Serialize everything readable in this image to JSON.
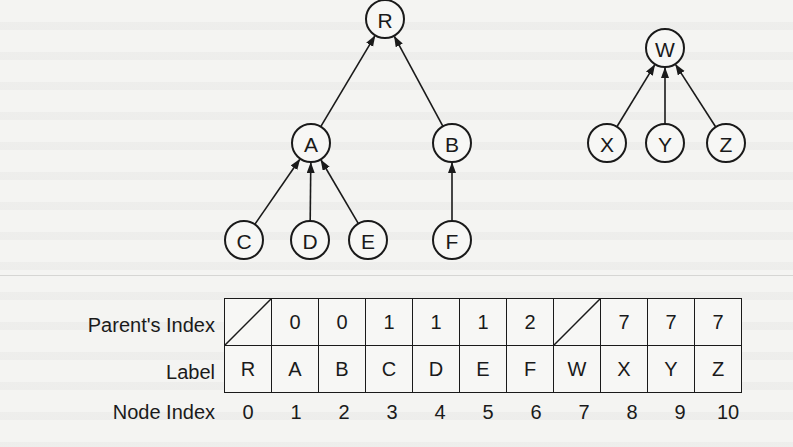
{
  "diagram": {
    "trees": [
      {
        "root": "R",
        "nodes": [
          {
            "id": "R",
            "label": "R",
            "x": 385,
            "y": 19
          },
          {
            "id": "A",
            "label": "A",
            "x": 311,
            "y": 143
          },
          {
            "id": "B",
            "label": "B",
            "x": 452,
            "y": 143
          },
          {
            "id": "C",
            "label": "C",
            "x": 244,
            "y": 240
          },
          {
            "id": "D",
            "label": "D",
            "x": 310,
            "y": 240
          },
          {
            "id": "E",
            "label": "E",
            "x": 368,
            "y": 240
          },
          {
            "id": "F",
            "label": "F",
            "x": 452,
            "y": 240
          }
        ],
        "edges": [
          {
            "from": "A",
            "to": "R"
          },
          {
            "from": "B",
            "to": "R"
          },
          {
            "from": "C",
            "to": "A"
          },
          {
            "from": "D",
            "to": "A"
          },
          {
            "from": "E",
            "to": "A"
          },
          {
            "from": "F",
            "to": "B"
          }
        ]
      },
      {
        "root": "W",
        "nodes": [
          {
            "id": "W",
            "label": "W",
            "x": 665,
            "y": 48
          },
          {
            "id": "X",
            "label": "X",
            "x": 607,
            "y": 143
          },
          {
            "id": "Y",
            "label": "Y",
            "x": 665,
            "y": 143
          },
          {
            "id": "Z",
            "label": "Z",
            "x": 726,
            "y": 143
          }
        ],
        "edges": [
          {
            "from": "X",
            "to": "W"
          },
          {
            "from": "Y",
            "to": "W"
          },
          {
            "from": "Z",
            "to": "W"
          }
        ]
      }
    ],
    "array_table": {
      "row_labels": {
        "parent": "Parent's Index",
        "label": "Label",
        "node_index": "Node Index"
      },
      "columns": [
        {
          "node_index": "0",
          "label": "R",
          "parent": null
        },
        {
          "node_index": "1",
          "label": "A",
          "parent": "0"
        },
        {
          "node_index": "2",
          "label": "B",
          "parent": "0"
        },
        {
          "node_index": "3",
          "label": "C",
          "parent": "1"
        },
        {
          "node_index": "4",
          "label": "D",
          "parent": "1"
        },
        {
          "node_index": "5",
          "label": "E",
          "parent": "1"
        },
        {
          "node_index": "6",
          "label": "F",
          "parent": "2"
        },
        {
          "node_index": "7",
          "label": "W",
          "parent": null
        },
        {
          "node_index": "8",
          "label": "X",
          "parent": "7"
        },
        {
          "node_index": "9",
          "label": "Y",
          "parent": "7"
        },
        {
          "node_index": "10",
          "label": "Z",
          "parent": "7"
        }
      ]
    }
  }
}
